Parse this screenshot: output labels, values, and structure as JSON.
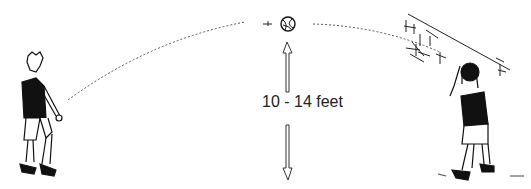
{
  "illustration": {
    "description": "Volleyball passing drill: player passes ball in high arc to partner near a wall",
    "distance_label": "10 - 14 feet",
    "elements": {
      "left_player": "passer-figure",
      "right_player": "setter-figure-at-wall",
      "ball": "volleyball-icon",
      "arc": "dotted-trajectory",
      "height_arrow": "double-arrow-vertical"
    },
    "colors": {
      "ink": "#111111",
      "background": "#ffffff"
    }
  }
}
